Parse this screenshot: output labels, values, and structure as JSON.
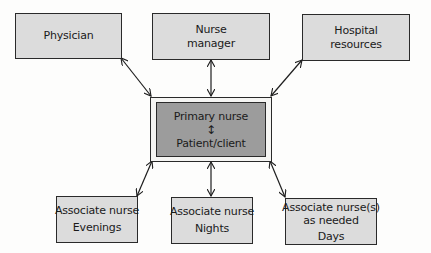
{
  "diagram": {
    "type": "relationship-diagram",
    "center": {
      "line1": "Primary nurse",
      "connector": "↕",
      "line2": "Patient/client"
    },
    "top_nodes": [
      {
        "id": "physician",
        "lines": [
          "Physician"
        ]
      },
      {
        "id": "nurse-manager",
        "lines": [
          "Nurse",
          "manager"
        ]
      },
      {
        "id": "hospital-resources",
        "lines": [
          "Hospital",
          "resources"
        ]
      }
    ],
    "bottom_nodes": [
      {
        "id": "associate-evenings",
        "lines": [
          "Associate nurse",
          "Evenings"
        ]
      },
      {
        "id": "associate-nights",
        "lines": [
          "Associate nurse",
          "Nights"
        ]
      },
      {
        "id": "associate-days",
        "lines": [
          "Associate nurse(s)",
          "as needed",
          "Days"
        ]
      }
    ],
    "edges": [
      {
        "from": "physician",
        "to": "center",
        "bidirectional": true
      },
      {
        "from": "nurse-manager",
        "to": "center",
        "bidirectional": true
      },
      {
        "from": "hospital-resources",
        "to": "center",
        "bidirectional": true
      },
      {
        "from": "center",
        "to": "associate-evenings",
        "bidirectional": true
      },
      {
        "from": "center",
        "to": "associate-nights",
        "bidirectional": true
      },
      {
        "from": "center",
        "to": "associate-days",
        "bidirectional": true
      }
    ],
    "colors": {
      "node_fill": "#dcdcdc",
      "center_fill": "#9c9c9c",
      "stroke": "#2a2a2a",
      "background": "#fdfdfc"
    }
  }
}
